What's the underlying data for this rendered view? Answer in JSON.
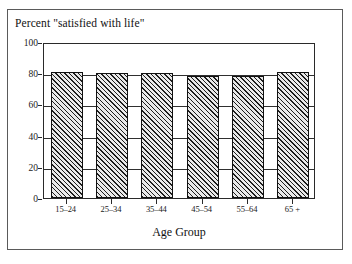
{
  "chart_data": {
    "type": "bar",
    "title": "Percent \"satisfied with life\"",
    "xlabel": "Age Group",
    "ylabel": "",
    "categories": [
      "15–24",
      "25–34",
      "35–44",
      "45–54",
      "55–64",
      "65 +"
    ],
    "values": [
      81,
      80,
      80,
      78,
      78,
      81
    ],
    "ylim": [
      0,
      100
    ],
    "yticks": [
      0,
      20,
      40,
      60,
      80,
      100
    ],
    "ytick_labels": [
      "0",
      "20",
      "40",
      "60",
      "80",
      "100"
    ],
    "grid": true,
    "legend": false,
    "bar_fill": "hatch-diagonal",
    "bar_color": "#e9e9e9",
    "bar_edge_color": "#111111",
    "axis_color": "#2a2a2a",
    "frame_color": "#5a5a5a",
    "background": "#ffffff"
  }
}
